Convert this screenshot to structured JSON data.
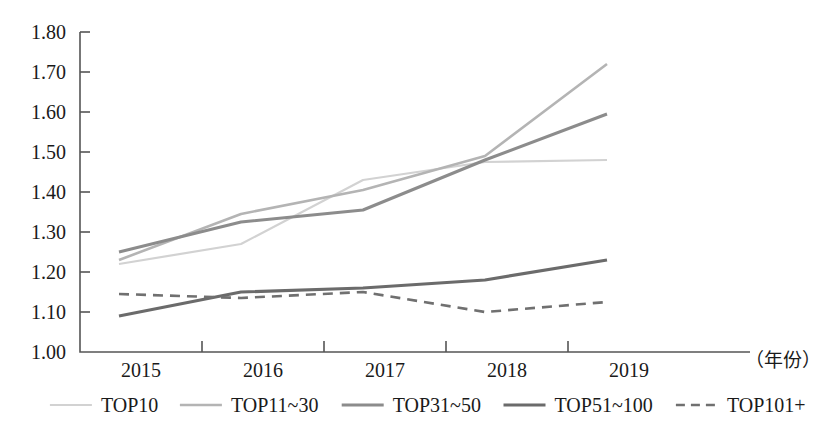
{
  "chart_data": {
    "type": "line",
    "title": "",
    "xlabel": "（年份）",
    "ylabel": "",
    "categories": [
      "2015",
      "2016",
      "2017",
      "2018",
      "2019"
    ],
    "x": [
      2015,
      2016,
      2017,
      2018,
      2019
    ],
    "ylim": [
      1.0,
      1.8
    ],
    "ytick_labels": [
      "1.00",
      "1.10",
      "1.20",
      "1.30",
      "1.40",
      "1.50",
      "1.60",
      "1.70",
      "1.80"
    ],
    "ytick_values": [
      1.0,
      1.1,
      1.2,
      1.3,
      1.4,
      1.5,
      1.6,
      1.7,
      1.8
    ],
    "grid": false,
    "legend_position": "bottom",
    "series": [
      {
        "name": "TOP10",
        "values": [
          1.22,
          1.27,
          1.43,
          1.475,
          1.48
        ],
        "color": "#d2d2d2",
        "width": 2.2,
        "dash": "none"
      },
      {
        "name": "TOP11~30",
        "values": [
          1.23,
          1.345,
          1.405,
          1.49,
          1.72
        ],
        "color": "#b4b4b4",
        "width": 2.6,
        "dash": "none"
      },
      {
        "name": "TOP31~50",
        "values": [
          1.25,
          1.325,
          1.355,
          1.48,
          1.595
        ],
        "color": "#8c8c8c",
        "width": 3.0,
        "dash": "none"
      },
      {
        "name": "TOP51~100",
        "values": [
          1.09,
          1.15,
          1.16,
          1.18,
          1.23
        ],
        "color": "#6b6b6b",
        "width": 3.2,
        "dash": "none"
      },
      {
        "name": "TOP101+",
        "values": [
          1.145,
          1.135,
          1.15,
          1.1,
          1.125
        ],
        "color": "#707070",
        "width": 2.6,
        "dash": "10,7"
      }
    ]
  },
  "axes": {
    "unit_label": "（年份）"
  },
  "legend": {
    "items": [
      {
        "label": "TOP10"
      },
      {
        "label": "TOP11~30"
      },
      {
        "label": "TOP31~50"
      },
      {
        "label": "TOP51~100"
      },
      {
        "label": "TOP101+"
      }
    ]
  }
}
